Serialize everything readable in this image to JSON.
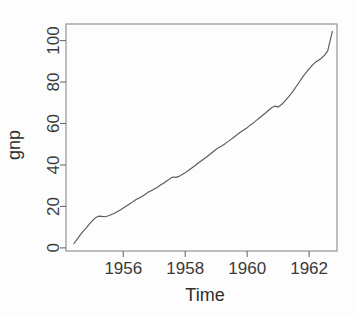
{
  "figure": {
    "title_clipped": "series gnp (q) 54-62",
    "title_visible": false,
    "background": "#fdfdfd",
    "line_color": "#5a5a5a",
    "axis_color": "#6e6e6e",
    "text_color": "#3a3a3a"
  },
  "chart_data": {
    "type": "line",
    "title": "",
    "xlabel": "Time",
    "ylabel": "gnp",
    "xlim": [
      1954.15,
      1962.9
    ],
    "ylim": [
      -1.5,
      108
    ],
    "grid": false,
    "legend": null,
    "xticks": [
      1956,
      1958,
      1960,
      1962
    ],
    "xticklabels": [
      "1956",
      "1958",
      "1960",
      "1962"
    ],
    "yticks": [
      0,
      20,
      40,
      60,
      80,
      100
    ],
    "yticklabels": [
      "0",
      "20",
      "40",
      "60",
      "80",
      "100"
    ],
    "series": [
      {
        "name": "gnp",
        "x": [
          1954.4,
          1954.5,
          1954.6,
          1954.7,
          1954.8,
          1954.9,
          1955.0,
          1955.1,
          1955.2,
          1955.3,
          1955.4,
          1955.5,
          1955.6,
          1955.7,
          1955.8,
          1955.9,
          1956.0,
          1956.1,
          1956.2,
          1956.3,
          1956.4,
          1956.5,
          1956.6,
          1956.7,
          1956.8,
          1956.9,
          1957.0,
          1957.1,
          1957.2,
          1957.3,
          1957.4,
          1957.5,
          1957.6,
          1957.7,
          1957.8,
          1957.9,
          1958.0,
          1958.1,
          1958.2,
          1958.3,
          1958.4,
          1958.5,
          1958.6,
          1958.7,
          1958.8,
          1958.9,
          1959.0,
          1959.1,
          1959.2,
          1959.3,
          1959.4,
          1959.5,
          1959.6,
          1959.7,
          1959.8,
          1959.9,
          1960.0,
          1960.1,
          1960.2,
          1960.3,
          1960.4,
          1960.5,
          1960.6,
          1960.7,
          1960.8,
          1960.9,
          1961.0,
          1961.1,
          1961.2,
          1961.3,
          1961.4,
          1961.5,
          1961.6,
          1961.7,
          1961.8,
          1961.9,
          1962.0,
          1962.1,
          1962.2,
          1962.3,
          1962.4,
          1962.5,
          1962.6,
          1962.75
        ],
        "y": [
          2.0,
          4.0,
          6.0,
          8.0,
          9.5,
          11.5,
          13.0,
          14.5,
          15.3,
          15.2,
          15.0,
          15.4,
          16.0,
          16.6,
          17.4,
          18.3,
          19.2,
          20.2,
          21.2,
          22.2,
          23.2,
          24.0,
          24.8,
          25.8,
          26.8,
          27.6,
          28.4,
          29.3,
          30.3,
          31.2,
          32.3,
          33.3,
          34.2,
          34.0,
          34.5,
          35.4,
          36.3,
          37.3,
          38.4,
          39.5,
          40.7,
          41.8,
          42.9,
          44.0,
          45.2,
          46.4,
          47.6,
          48.6,
          49.4,
          50.4,
          51.5,
          52.6,
          53.7,
          54.9,
          56.0,
          57.0,
          58.0,
          59.2,
          60.3,
          61.5,
          62.8,
          64.0,
          65.2,
          66.5,
          67.7,
          68.4,
          68.0,
          69.0,
          70.5,
          72.2,
          74.0,
          76.0,
          78.2,
          80.4,
          82.6,
          84.6,
          86.4,
          88.0,
          89.5,
          90.5,
          91.5,
          93.0,
          95.0,
          104.5
        ]
      }
    ],
    "annotations": []
  }
}
